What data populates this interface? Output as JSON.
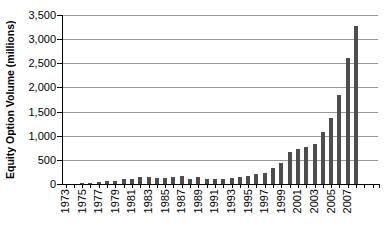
{
  "chart_data": {
    "type": "bar",
    "title": "",
    "ylabel": "Equity Option Volume (millions)",
    "xlabel": "",
    "ylim": [
      0,
      3500
    ],
    "ytick_interval": 500,
    "ytick_labels": [
      "0",
      "500",
      "1,000",
      "1,500",
      "2,000",
      "2,500",
      "3,000",
      "3,500"
    ],
    "categories": [
      "1973",
      "1974",
      "1975",
      "1976",
      "1977",
      "1978",
      "1979",
      "1980",
      "1981",
      "1982",
      "1983",
      "1984",
      "1985",
      "1986",
      "1987",
      "1988",
      "1989",
      "1990",
      "1991",
      "1992",
      "1993",
      "1994",
      "1995",
      "1996",
      "1997",
      "1998",
      "1999",
      "2000",
      "2001",
      "2002",
      "2003",
      "2004",
      "2005",
      "2006",
      "2007",
      "2008"
    ],
    "values": [
      1,
      6,
      18,
      32,
      39,
      57,
      64,
      97,
      109,
      137,
      136,
      119,
      119,
      142,
      164,
      114,
      142,
      111,
      104,
      106,
      132,
      149,
      174,
      199,
      233,
      330,
      444,
      673,
      723,
      761,
      830,
      1084,
      1369,
      1843,
      2613,
      3277
    ],
    "xtick_labels": [
      "1973",
      "1975",
      "1977",
      "1979",
      "1981",
      "1983",
      "1985",
      "1987",
      "1989",
      "1991",
      "1993",
      "1995",
      "1997",
      "1999",
      "2001",
      "2003",
      "2005",
      "2007"
    ],
    "xtick_label_every": 2,
    "extra_axis_tick_slots": 2,
    "grid": "horizontal",
    "legend": "none",
    "colors": {
      "bar": "#4d4d4d",
      "gridline": "#999999",
      "axis": "#000000",
      "tick": "#000000",
      "text": "#000000",
      "background": "#ffffff"
    }
  }
}
